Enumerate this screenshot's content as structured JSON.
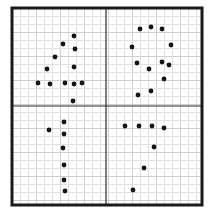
{
  "figure": {
    "width": 214,
    "height": 214,
    "background": "#ffffff",
    "frame": {
      "x": 12,
      "y": 8,
      "width": 190,
      "height": 197,
      "stroke": "#1a1a1a",
      "stroke_width": 3
    },
    "dividers": {
      "vertical_x": 106,
      "horizontal_y": 106,
      "stroke": "#2a2a2a",
      "stroke_width": 1.2
    },
    "grid": {
      "spacing": 8,
      "minor_color": "#e2e2e2",
      "major_every": 3,
      "major_color": "#cfcfcf"
    },
    "dot_color": "#151515",
    "dot_radius": 2.4
  },
  "quadrants": [
    {
      "id": "top-left",
      "shape": "digit-4",
      "dots": [
        [
          74,
          36
        ],
        [
          63,
          44
        ],
        [
          75,
          49
        ],
        [
          55,
          57
        ],
        [
          47,
          69
        ],
        [
          74,
          67
        ],
        [
          38,
          83
        ],
        [
          50,
          84
        ],
        [
          65,
          83
        ],
        [
          74,
          84
        ],
        [
          82,
          83
        ],
        [
          73,
          101
        ]
      ]
    },
    {
      "id": "top-right",
      "shape": "digit-9",
      "dots": [
        [
          140,
          29
        ],
        [
          151,
          27
        ],
        [
          162,
          29
        ],
        [
          132,
          47
        ],
        [
          171,
          45
        ],
        [
          137,
          63
        ],
        [
          149,
          69
        ],
        [
          162,
          62
        ],
        [
          169,
          65
        ],
        [
          164,
          79
        ],
        [
          151,
          91
        ],
        [
          138,
          95
        ]
      ]
    },
    {
      "id": "bottom-left",
      "shape": "digit-1",
      "dots": [
        [
          64,
          122
        ],
        [
          49,
          130
        ],
        [
          64,
          134
        ],
        [
          63,
          148
        ],
        [
          64,
          165
        ],
        [
          64,
          180
        ],
        [
          65,
          191
        ]
      ]
    },
    {
      "id": "bottom-right",
      "shape": "digit-7",
      "dots": [
        [
          125,
          126
        ],
        [
          139,
          126
        ],
        [
          152,
          126
        ],
        [
          164,
          128
        ],
        [
          154,
          147
        ],
        [
          144,
          168
        ],
        [
          133,
          190
        ]
      ]
    }
  ]
}
